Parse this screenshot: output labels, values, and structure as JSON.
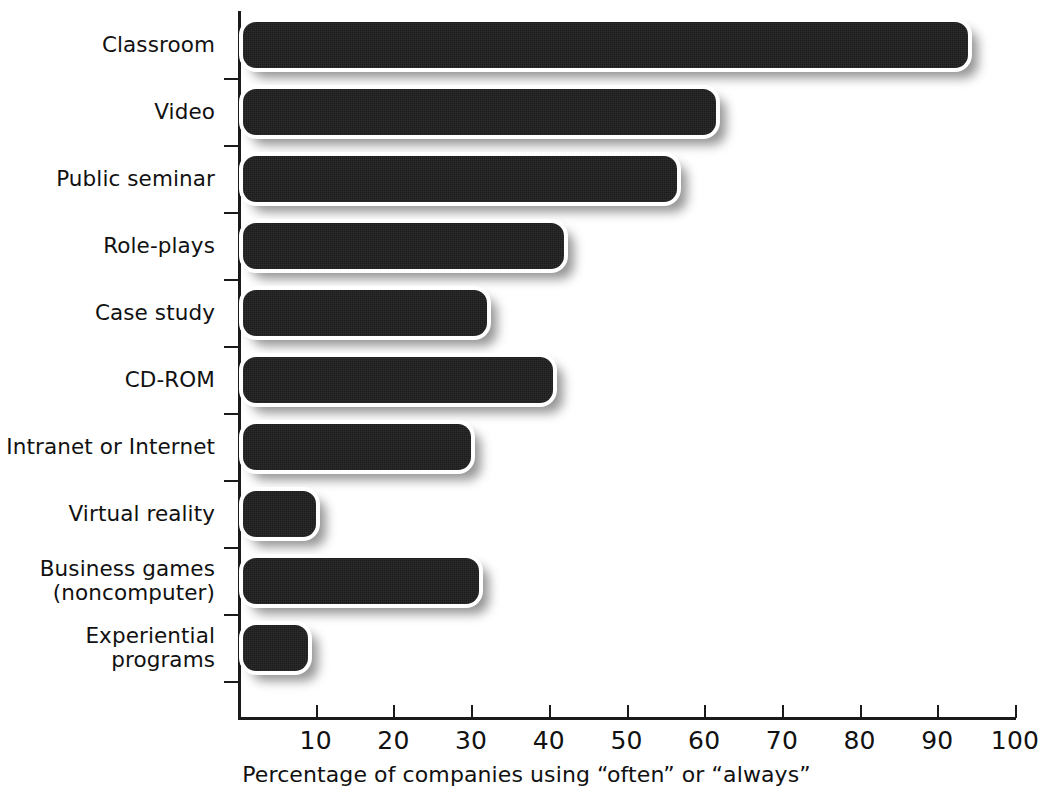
{
  "chart_data": {
    "type": "bar",
    "orientation": "horizontal",
    "title": "",
    "subtitle": "",
    "xlabel": "Percentage of companies using “often” or “always”",
    "ylabel": "",
    "categories": [
      "Classroom",
      "Video",
      "Public seminar",
      "Role-plays",
      "Case study",
      "CD-ROM",
      "Intranet or Internet",
      "Virtual reality",
      "Business games\n(noncomputer)",
      "Experiential\nprograms"
    ],
    "values": [
      94,
      61.5,
      56.5,
      42,
      32,
      40.5,
      30,
      10,
      31,
      9
    ],
    "xlim": [
      0,
      100
    ],
    "xticks": [
      0,
      10,
      20,
      30,
      40,
      50,
      60,
      70,
      80,
      90,
      100
    ],
    "xtick_labels": [
      "",
      "10",
      "20",
      "30",
      "40",
      "50",
      "60",
      "70",
      "80",
      "90",
      "100"
    ],
    "grid": false,
    "legend": null,
    "bar_color": "#1c1c1c",
    "axis_color": "#1a1a1a",
    "background_color": "#ffffff"
  },
  "axis": {
    "caption": "Percentage of companies using “often” or “always”"
  }
}
